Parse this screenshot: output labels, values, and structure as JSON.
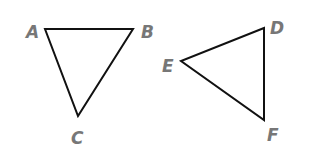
{
  "diagram": {
    "triangles": [
      {
        "name": "ABC",
        "points": "45,29 133,29 78,116",
        "vertices": [
          {
            "label": "A",
            "x": 30,
            "y": 38
          },
          {
            "label": "B",
            "x": 146,
            "y": 38
          },
          {
            "label": "C",
            "x": 73,
            "y": 144
          }
        ]
      },
      {
        "name": "DEF",
        "points": "264,28 181,61 264,120",
        "vertices": [
          {
            "label": "D",
            "x": 271,
            "y": 34
          },
          {
            "label": "E",
            "x": 163,
            "y": 72
          },
          {
            "label": "F",
            "x": 268,
            "y": 141
          }
        ]
      }
    ],
    "colors": {
      "stroke": "#111111",
      "label": "#777777",
      "background": "#ffffff"
    }
  }
}
